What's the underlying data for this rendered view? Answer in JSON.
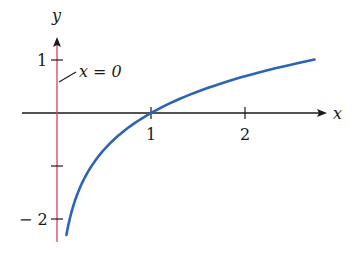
{
  "chart_data": {
    "type": "line",
    "title": "",
    "function": "y = ln(x)",
    "xlabel": "x",
    "ylabel": "y",
    "xlim": [
      -0.6,
      2.95
    ],
    "ylim": [
      -2.3,
      1.5
    ],
    "x_ticks": [
      1,
      2
    ],
    "x_tick_labels": [
      "1",
      "2"
    ],
    "y_ticks": [
      1,
      -1,
      -2
    ],
    "y_tick_labels": [
      "1",
      "",
      "− 2"
    ],
    "grid": false,
    "legend": null,
    "series": [
      {
        "name": "ln(x)",
        "color": "#2c64b5",
        "x": [
          0.1,
          0.15,
          0.2,
          0.3,
          0.4,
          0.5,
          0.6,
          0.8,
          1.0,
          1.25,
          1.5,
          1.75,
          2.0,
          2.25,
          2.5,
          2.74
        ],
        "y": [
          -2.3,
          -1.9,
          -1.61,
          -1.2,
          -0.92,
          -0.69,
          -0.51,
          -0.22,
          0.0,
          0.22,
          0.41,
          0.56,
          0.69,
          0.81,
          0.92,
          1.01
        ]
      }
    ],
    "annotations": [
      {
        "text": "x = 0",
        "type": "vertical-asymptote",
        "x": 0,
        "color": "#d9405a"
      }
    ]
  },
  "labels": {
    "x_axis": "x",
    "y_axis": "y",
    "tick_x1": "1",
    "tick_x2": "2",
    "tick_y1": "1",
    "tick_ym2": "− 2",
    "asymptote": "x = 0"
  },
  "colors": {
    "axis": "#1a1a1a",
    "curve": "#2c64b5",
    "asymptote": "#d9405a"
  }
}
